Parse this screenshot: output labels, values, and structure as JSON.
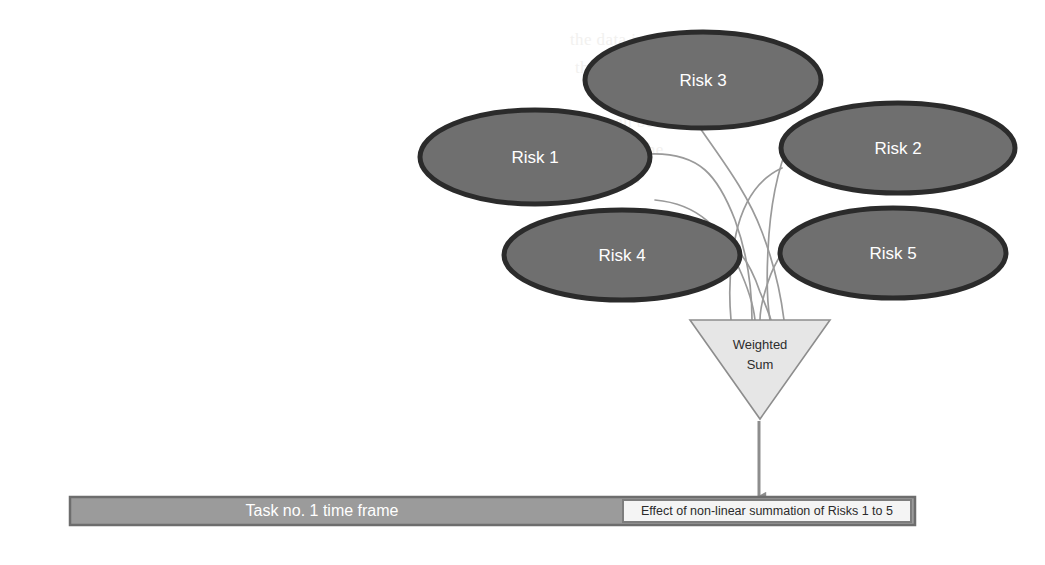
{
  "diagram": {
    "colors": {
      "ellipse_fill": "#6f6f6f",
      "ellipse_stroke": "#2b2b2b",
      "ellipse_text": "#ffffff",
      "connector_line": "#9a9a9a",
      "triangle_fill": "#e6e6e6",
      "triangle_stroke": "#8d8d8d",
      "triangle_text": "#2d2d2d",
      "arrow": "#8d8d8d",
      "bar_fill": "#9b9b9b",
      "bar_stroke": "#6d6d6d",
      "bar_text": "#ffffff",
      "effect_box_fill": "#f4f4f4",
      "effect_box_stroke": "#7d7d7d",
      "effect_box_text": "#2b2b2b",
      "background": "#ffffff"
    },
    "risk_nodes": [
      {
        "id": "risk-1",
        "label": "Risk 1",
        "cx": 535,
        "cy": 157,
        "rx": 115,
        "ry": 47
      },
      {
        "id": "risk-2",
        "label": "Risk 2",
        "cx": 898,
        "cy": 148,
        "rx": 117,
        "ry": 45
      },
      {
        "id": "risk-3",
        "label": "Risk 3",
        "cx": 703,
        "cy": 80,
        "rx": 118,
        "ry": 48
      },
      {
        "id": "risk-4",
        "label": "Risk 4",
        "cx": 622,
        "cy": 255,
        "rx": 118,
        "ry": 45
      },
      {
        "id": "risk-5",
        "label": "Risk 5",
        "cx": 893,
        "cy": 253,
        "rx": 113,
        "ry": 45
      }
    ],
    "aggregator": {
      "id": "weighted-sum",
      "label_line_1": "Weighted",
      "label_line_2": "Sum",
      "left": 690,
      "right": 830,
      "top": 320,
      "apex_x": 760,
      "apex_y": 419
    },
    "arrow": {
      "id": "aggregator-to-timeline-arrow",
      "x": 759,
      "y_start": 421,
      "y_end": 497
    },
    "timeline_bar": {
      "id": "task-time-frame-bar",
      "label": "Task no. 1 time frame",
      "x": 70,
      "y": 497,
      "width": 845,
      "height": 28
    },
    "effect_box": {
      "id": "effect-of-summation-box",
      "label": "Effect of  non-linear summation of Risks 1 to 5",
      "x": 623,
      "y": 500,
      "width": 288,
      "height": 22
    },
    "connectors": [
      {
        "from": "risk-1",
        "to": "weighted-sum"
      },
      {
        "from": "risk-2",
        "to": "weighted-sum"
      },
      {
        "from": "risk-3",
        "to": "weighted-sum"
      },
      {
        "from": "risk-4",
        "to": "weighted-sum"
      },
      {
        "from": "risk-5",
        "to": "weighted-sum"
      }
    ],
    "background_bleed_text": [
      {
        "text": "the data into the",
        "x": 570,
        "y": 30
      },
      {
        "text": "the model",
        "x": 575,
        "y": 58
      },
      {
        "text": "f the can be",
        "x": 570,
        "y": 112
      },
      {
        "text": "nodes and the",
        "x": 565,
        "y": 140
      },
      {
        "text": "the nodes",
        "x": 572,
        "y": 168
      }
    ]
  }
}
